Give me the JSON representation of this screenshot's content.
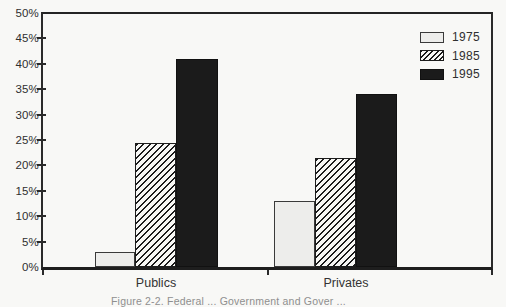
{
  "chart_data": {
    "type": "bar",
    "categories": [
      "Publics",
      "Privates"
    ],
    "series": [
      {
        "name": "1975",
        "pattern": "plain",
        "values": [
          3,
          13
        ]
      },
      {
        "name": "1985",
        "pattern": "hatch",
        "values": [
          24.5,
          21.5
        ]
      },
      {
        "name": "1995",
        "pattern": "solid",
        "values": [
          41,
          34
        ]
      }
    ],
    "title": "",
    "xlabel": "",
    "ylabel": "",
    "ylim": [
      0,
      50
    ],
    "ytick_step": 5,
    "ytick_labels": [
      "0%",
      "5%",
      "10%",
      "15%",
      "20%",
      "25%",
      "30%",
      "35%",
      "40%",
      "45%",
      "50%"
    ],
    "legend": {
      "position": "top-right",
      "entries": [
        "1975",
        "1985",
        "1995"
      ]
    },
    "grid": false
  },
  "caption": {
    "text": "Figure 2-2. Federal ...  Government and Gover ..."
  },
  "colors": {
    "paper": "#f8f8f6",
    "axis_line": "#242424",
    "text": "#2f2f2f",
    "series_1975_fill": "#ededeb",
    "series_1985_hatch_line": "#1c1c1c",
    "series_1995_fill": "#1b1b1b",
    "caption_text": "#8f8f8f"
  }
}
